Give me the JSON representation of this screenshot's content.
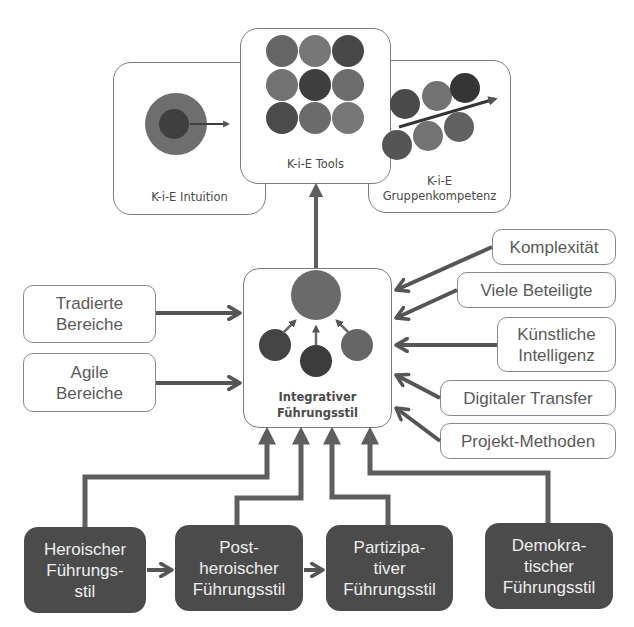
{
  "diagram": {
    "top_cards": {
      "intuition": {
        "label": "K-i-E Intuition"
      },
      "tools": {
        "label": "K-i-E Tools"
      },
      "group": {
        "line1": "K-i-E",
        "line2": "Gruppenkompetenz"
      }
    },
    "center": {
      "line1": "Integrativer",
      "line2": "Führungsstil"
    },
    "left_inputs": [
      {
        "line1": "Tradierte",
        "line2": "Bereiche"
      },
      {
        "line1": "Agile",
        "line2": "Bereiche"
      }
    ],
    "right_inputs": [
      {
        "line1": "Komplexität"
      },
      {
        "line1": "Viele Beteiligte"
      },
      {
        "line1": "Künstliche",
        "line2": "Intelligenz"
      },
      {
        "line1": "Digitaler Transfer"
      },
      {
        "line1": "Projekt-Methoden"
      }
    ],
    "leadership_styles": [
      {
        "line1": "Heroischer",
        "line2": "Führungs-",
        "line3": "stil"
      },
      {
        "line1": "Post-",
        "line2": "heroischer",
        "line3": "Führungsstil"
      },
      {
        "line1": "Partizipa-",
        "line2": "tiver",
        "line3": "Führungsstil"
      },
      {
        "line1": "Demokra-",
        "line2": "tischer",
        "line3": "Führungsstil"
      }
    ],
    "colors": {
      "arrow": "#5a5a5a",
      "dark_box": "#4b4b4b",
      "border": "#8a8a8a",
      "circle_mid": "#6e6e6e",
      "circle_dark": "#424242",
      "circle_light": "#7a7a7a"
    }
  }
}
